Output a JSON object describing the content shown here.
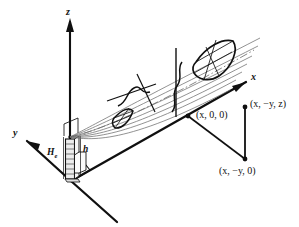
{
  "figure": {
    "caption_fragment": "",
    "background_color": "#ffffff",
    "ink_color": "#101010",
    "ray_color": "#6e6e6e",
    "tower_fill": "#e8e8e8",
    "width": 299,
    "height": 227
  },
  "axes": {
    "z_label": "z",
    "x_label": "x",
    "y_label": "y"
  },
  "dimensions": {
    "effective_height_label": "H",
    "effective_height_sub": "e",
    "tower_height_label": "h"
  },
  "points": [
    {
      "name": "origin-projection",
      "label": "(x, 0, 0)"
    },
    {
      "name": "field-point",
      "label": "(x, −y, z)"
    },
    {
      "name": "ground-point",
      "label": "(x, −y, 0)"
    }
  ],
  "point_labels": {
    "x00": "(x, 0, 0)",
    "xyz": "(x, −y, z)",
    "xy0": "(x, −y, 0)"
  },
  "beam": {
    "near_lobe_name": "near-beam-cross-section",
    "far_lobe_name": "far-beam-cross-section",
    "profile_near_name": "near-field-profile-curve",
    "profile_mid_name": "mid-field-profile-curve",
    "ray_count": 7
  }
}
